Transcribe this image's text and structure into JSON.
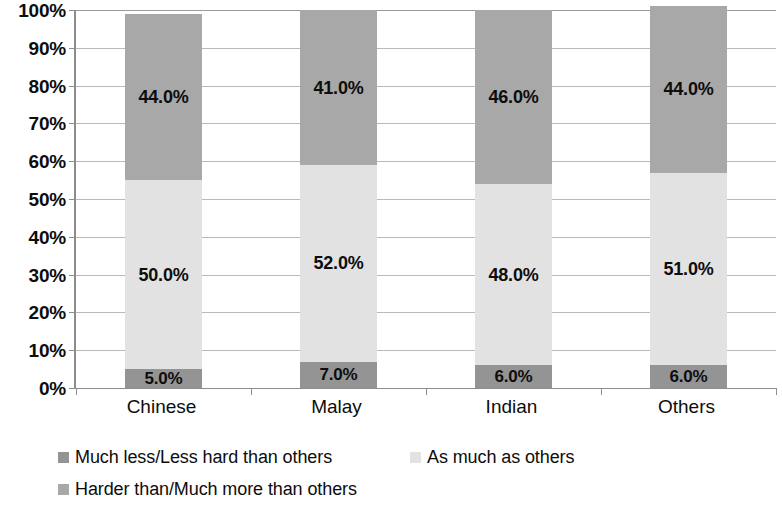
{
  "chart_data": {
    "type": "bar",
    "subtype": "stacked-100-percent",
    "title": "",
    "xlabel": "",
    "ylabel": "",
    "categories": [
      "Chinese",
      "Malay",
      "Indian",
      "Others"
    ],
    "series": [
      {
        "name": "Much less/Less hard than others",
        "color": "#949494",
        "values": [
          5.0,
          7.0,
          6.0,
          6.0
        ],
        "labels": [
          "5.0%",
          "7.0%",
          "6.0%",
          "6.0%"
        ]
      },
      {
        "name": "As much as others",
        "color": "#e2e2e2",
        "values": [
          50.0,
          52.0,
          48.0,
          51.0
        ],
        "labels": [
          "50.0%",
          "52.0%",
          "48.0%",
          "51.0%"
        ]
      },
      {
        "name": "Harder than/Much more than others",
        "color": "#a8a8a8",
        "values": [
          44.0,
          41.0,
          46.0,
          44.0
        ],
        "labels": [
          "44.0%",
          "41.0%",
          "46.0%",
          "44.0%"
        ]
      }
    ],
    "ylim": [
      0,
      100
    ],
    "yticks": [
      0,
      10,
      20,
      30,
      40,
      50,
      60,
      70,
      80,
      90,
      100
    ],
    "ytick_labels": [
      "0%",
      "10%",
      "20%",
      "30%",
      "40%",
      "50%",
      "60%",
      "70%",
      "80%",
      "90%",
      "100%"
    ],
    "grid": true,
    "grid_axis": "y",
    "legend_position": "bottom-left",
    "legend": [
      "Much less/Less hard than others",
      "As much as others",
      "Harder than/Much more than others"
    ]
  },
  "colors": {
    "segment_bottom": "#949494",
    "segment_middle": "#e2e2e2",
    "segment_top": "#a8a8a8",
    "gridline": "#b9b9b9",
    "axis": "#8d8d8d",
    "text": "#0d0d0d",
    "background": "#ffffff"
  }
}
